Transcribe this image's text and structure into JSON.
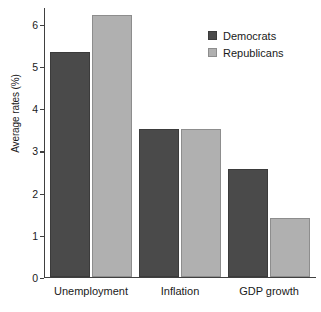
{
  "chart_data": {
    "type": "bar",
    "title": "",
    "xlabel": "",
    "ylabel": "Average rates (%)",
    "categories": [
      "Unemployment",
      "Inflation",
      "GDP growth"
    ],
    "series": [
      {
        "name": "Democrats",
        "color": "#4a4a4a",
        "values": [
          5.34,
          3.52,
          2.56
        ]
      },
      {
        "name": "Republicans",
        "color": "#b0b0b0",
        "values": [
          6.21,
          3.52,
          1.41
        ]
      }
    ],
    "ylim": [
      0,
      6.4
    ],
    "yticks": [
      0,
      1,
      2,
      3,
      4,
      5,
      6
    ],
    "ytick_labels": [
      "0",
      "1",
      "2",
      "3",
      "4",
      "5",
      "6"
    ],
    "grid": false,
    "legend_position": "top-right"
  },
  "legend": {
    "items": [
      {
        "label": "Democrats"
      },
      {
        "label": "Republicans"
      }
    ]
  }
}
